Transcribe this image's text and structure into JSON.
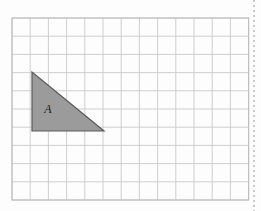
{
  "figure": {
    "background_color": "#fdfdfd",
    "width": 261,
    "height": 211
  },
  "grid": {
    "name": "square-grid",
    "origin_x": 12,
    "origin_y": 18,
    "cell_size": 18.2,
    "columns": 13,
    "rows": 10,
    "line_color": "#c9c9c9",
    "line_width": 0.9,
    "border_color": "#bdbdbd",
    "border_width": 1.1,
    "visible": true
  },
  "shapes": [
    {
      "name": "triangle-a",
      "type": "right-triangle",
      "label": "A",
      "fill_color": "#9b9b9b",
      "stroke_color": "#5a5a5a",
      "stroke_width": 1.2,
      "vertices_px": [
        {
          "x": 32,
          "y": 72
        },
        {
          "x": 32,
          "y": 131
        },
        {
          "x": 104,
          "y": 131
        }
      ],
      "vertices_grid": [
        {
          "col": 1,
          "row": 3
        },
        {
          "col": 1,
          "row": 6
        },
        {
          "col": 5,
          "row": 6
        }
      ],
      "base_cells": 4,
      "height_cells": 3,
      "label_position_px": {
        "x": 48,
        "y": 113
      }
    }
  ],
  "decorations": {
    "right_edge_rule": {
      "name": "dotted-right-rule",
      "x": 254,
      "y_start": 0,
      "y_end": 211,
      "color": "#b4b4b4",
      "dash": "2 3",
      "width": 1.4
    }
  },
  "chart_data": {
    "type": "scatter",
    "xlabel": "",
    "ylabel": "",
    "xlim": [
      0,
      13
    ],
    "ylim": [
      0,
      10
    ],
    "grid": true,
    "legend": "none",
    "annotations": [
      "A"
    ],
    "series": [
      {
        "name": "triangle-a",
        "x": [
          1,
          1,
          5,
          1
        ],
        "y": [
          7,
          4,
          4,
          7
        ]
      }
    ]
  }
}
